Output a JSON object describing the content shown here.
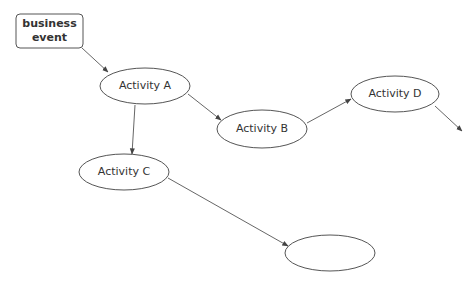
{
  "diagram": {
    "type": "process-flow",
    "colors": {
      "stroke": "#555555",
      "text": "#333333",
      "background": "#ffffff"
    },
    "nodes": [
      {
        "id": "start",
        "shape": "rounded-rect",
        "label": "business\nevent",
        "line1": "business",
        "line2": "event",
        "x": 16,
        "y": 14,
        "w": 67,
        "h": 34
      },
      {
        "id": "A",
        "shape": "ellipse",
        "label": "Activity A",
        "cx": 145,
        "cy": 86,
        "rx": 45,
        "ry": 18
      },
      {
        "id": "B",
        "shape": "ellipse",
        "label": "Activity B",
        "cx": 262,
        "cy": 129,
        "rx": 45,
        "ry": 19
      },
      {
        "id": "C",
        "shape": "ellipse",
        "label": "Activity C",
        "cx": 124,
        "cy": 172,
        "rx": 45,
        "ry": 18
      },
      {
        "id": "D",
        "shape": "ellipse",
        "label": "Activity D",
        "cx": 395,
        "cy": 94,
        "rx": 44,
        "ry": 18
      },
      {
        "id": "E",
        "shape": "ellipse",
        "label": "",
        "cx": 330,
        "cy": 253,
        "rx": 45,
        "ry": 18
      }
    ],
    "edges": [
      {
        "from": "start",
        "to": "A"
      },
      {
        "from": "A",
        "to": "B"
      },
      {
        "from": "A",
        "to": "C"
      },
      {
        "from": "B",
        "to": "D"
      },
      {
        "from": "D",
        "to": "offscreen"
      },
      {
        "from": "C",
        "to": "E"
      }
    ]
  }
}
